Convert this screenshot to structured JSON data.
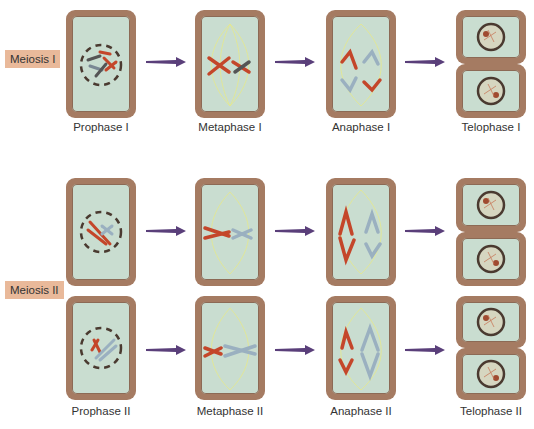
{
  "rows": {
    "meiosis1": {
      "label": "Meiosis I"
    },
    "meiosis2": {
      "label": "Meiosis II"
    }
  },
  "stages": {
    "prophase1": "Prophase I",
    "metaphase1": "Metaphase I",
    "anaphase1": "Anaphase I",
    "telophase1": "Telophase I",
    "prophase2": "Prophase II",
    "metaphase2": "Metaphase II",
    "anaphase2": "Anaphase II",
    "telophase2": "Telophase II"
  },
  "colors": {
    "cell_border": "#a57b62",
    "cytoplasm": "#c9ddd0",
    "label_bg": "#e9b99a",
    "arrow": "#5a3f7a",
    "chrom_red": "#c4462a",
    "chrom_blue": "#9ab0c0",
    "spindle": "#e6e88a"
  }
}
